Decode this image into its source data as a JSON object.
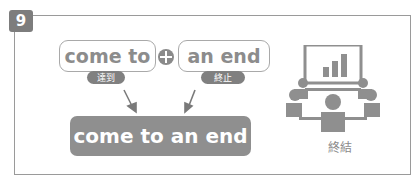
{
  "badge": {
    "number": "9"
  },
  "parts": [
    {
      "word": "come to",
      "gloss": "達到"
    },
    {
      "word": "an end",
      "gloss": "終止"
    }
  ],
  "operator": {
    "icon": "plus-circle-icon"
  },
  "result": {
    "phrase": "come to an end"
  },
  "illustration": {
    "icon": "meeting-presentation-icon",
    "caption": "終結"
  },
  "colors": {
    "frame": "#9a9a9a",
    "badge": "#7d7d7d",
    "result_bg": "#8f8f8f",
    "text_gray": "#8c8c8c"
  }
}
